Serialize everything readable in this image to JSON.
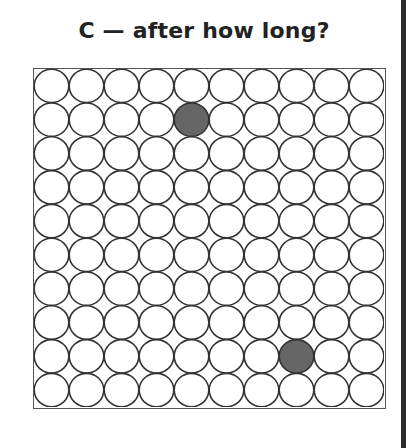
{
  "title": "C — after how long?",
  "grid": {
    "rows": 10,
    "cols": 10,
    "empty_fill": "#ffffff",
    "stroke": "#333333",
    "filled_color": "#666666",
    "filled_cells": [
      {
        "row": 1,
        "col": 4
      },
      {
        "row": 8,
        "col": 7
      }
    ]
  }
}
